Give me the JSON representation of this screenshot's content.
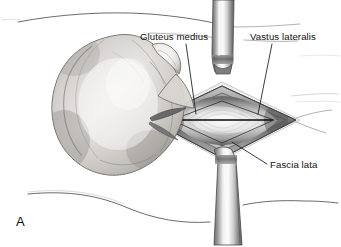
{
  "figure": {
    "panel_letter": "A",
    "style": "grayscale medical line illustration with tonal shading"
  },
  "annotations": [
    {
      "id": "gluteus-medius",
      "label": "Gluteus medius",
      "text_x": 140,
      "text_y": 40,
      "leader": {
        "x1": 186,
        "y1": 44,
        "x2": 196,
        "y2": 114
      }
    },
    {
      "id": "vastus-lateralis",
      "label": "Vastus lateralis",
      "text_x": 250,
      "text_y": 40,
      "leader": {
        "x1": 272,
        "y1": 44,
        "x2": 258,
        "y2": 114
      }
    },
    {
      "id": "fascia-lata",
      "label": "Fascia lata",
      "text_x": 270,
      "text_y": 168,
      "leader": {
        "x1": 267,
        "y1": 164,
        "x2": 232,
        "y2": 142
      }
    }
  ],
  "structures": {
    "bone_specimen": "greater trochanter / proximal femur soft-tissue mass",
    "wound": "diamond-shaped fascial incision with retracted edges",
    "retractor_top": "metallic retractor blade, superior",
    "retractor_bottom": "metallic retractor blade, inferior",
    "incision": "central horizontal fascial split line"
  },
  "colors": {
    "background": "#ffffff",
    "ink": "#1a1a1a",
    "contour": "#5a5a5a",
    "contour_faint": "#9a9a9a",
    "tissue_dark": "#4a4a4a",
    "tissue_mid": "#8c8c8c",
    "tissue_light": "#d8d8d8",
    "metal_light": "#e8e8e8",
    "metal_dark": "#6f6f6f",
    "bone_light": "#f2f0ee",
    "bone_shadow": "#9b9793"
  }
}
